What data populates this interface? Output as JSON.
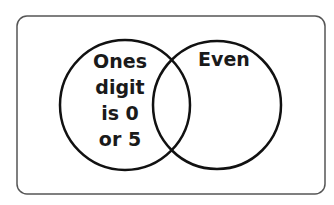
{
  "diagram": {
    "type": "venn",
    "sets": [
      {
        "name": "ones-digit-0-or-5",
        "label_lines": [
          "Ones",
          "digit",
          "is 0",
          "or 5"
        ]
      },
      {
        "name": "even",
        "label_lines": [
          "Even"
        ]
      }
    ],
    "colors": {
      "stroke": "#111111",
      "frame": "#555555",
      "background": "#ffffff"
    }
  }
}
